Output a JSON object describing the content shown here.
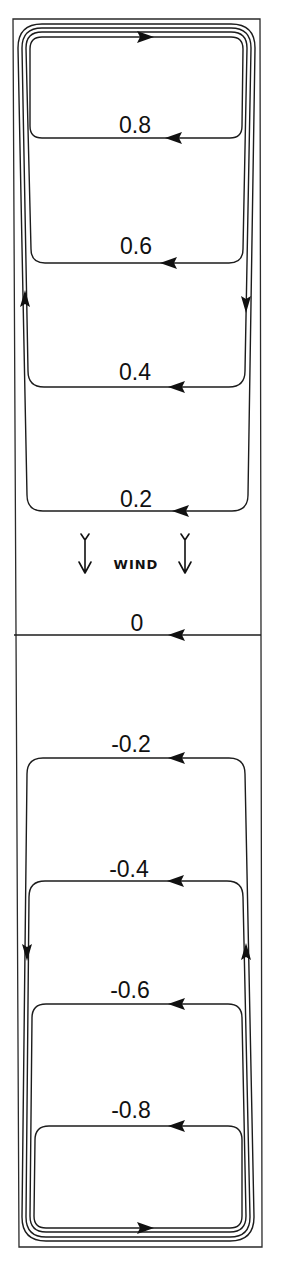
{
  "figure": {
    "type": "streamline-diagram",
    "line_color": "#1c1c1c",
    "background": "#ffffff",
    "wind": {
      "label": "WIND",
      "direction": "down",
      "icon": "arrow-down-icon"
    },
    "upper_cell": {
      "circulation": "clockwise",
      "contours": [
        {
          "value": "0.8"
        },
        {
          "value": "0.6"
        },
        {
          "value": "0.4"
        },
        {
          "value": "0.2"
        }
      ]
    },
    "zero_line": {
      "value": "0"
    },
    "lower_cell": {
      "circulation": "counter-clockwise",
      "contours": [
        {
          "value": "-0.2"
        },
        {
          "value": "-0.4"
        },
        {
          "value": "-0.6"
        },
        {
          "value": "-0.8"
        }
      ]
    }
  }
}
